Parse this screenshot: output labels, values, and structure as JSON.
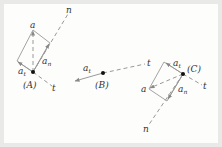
{
  "colors": {
    "background": "#e9e9e7",
    "panel": "#fdfdfc",
    "line": "#8a8a8a",
    "text": "#333333",
    "point": "#111111"
  },
  "diagram": {
    "points": {
      "A": {
        "label": "(A)",
        "a": "a",
        "a_t": "a",
        "a_t_sub": "t",
        "a_n": "a",
        "a_n_sub": "n",
        "n_axis": "n",
        "t_axis": "t"
      },
      "B": {
        "label": "(B)",
        "a_t": "a",
        "a_t_sub": "t",
        "t_axis": "t"
      },
      "C": {
        "label": "(C)",
        "a": "a",
        "a_t": "a",
        "a_t_sub": "t",
        "a_n": "a",
        "a_n_sub": "n",
        "n_axis": "n",
        "t_axis": "t"
      }
    }
  }
}
